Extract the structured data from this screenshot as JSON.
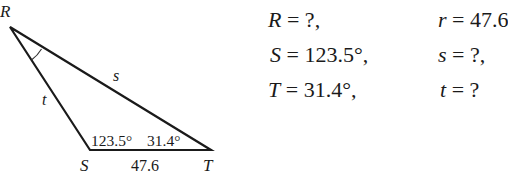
{
  "diagram": {
    "vertices": {
      "R": {
        "label": "R",
        "x": 10,
        "y": 27
      },
      "S": {
        "label": "S",
        "x": 90,
        "y": 150
      },
      "T": {
        "label": "T",
        "x": 211,
        "y": 150
      }
    },
    "side_labels": {
      "s": "s",
      "t": "t",
      "r_value": "47.6"
    },
    "angle_labels": {
      "S": "123.5°",
      "T": "31.4°"
    },
    "angle_marker_at": "R",
    "stroke_color": "#1a1a1a"
  },
  "equations": {
    "rows": [
      {
        "left_var": "R",
        "left_val": " = ?,",
        "right_var": "r",
        "right_val": " = 47.6"
      },
      {
        "left_var": "S",
        "left_val": " = 123.5°,",
        "right_var": "s",
        "right_val": " = ?,"
      },
      {
        "left_var": "T",
        "left_val": " = 31.4°,",
        "right_var": "t",
        "right_val": " = ?"
      }
    ]
  }
}
